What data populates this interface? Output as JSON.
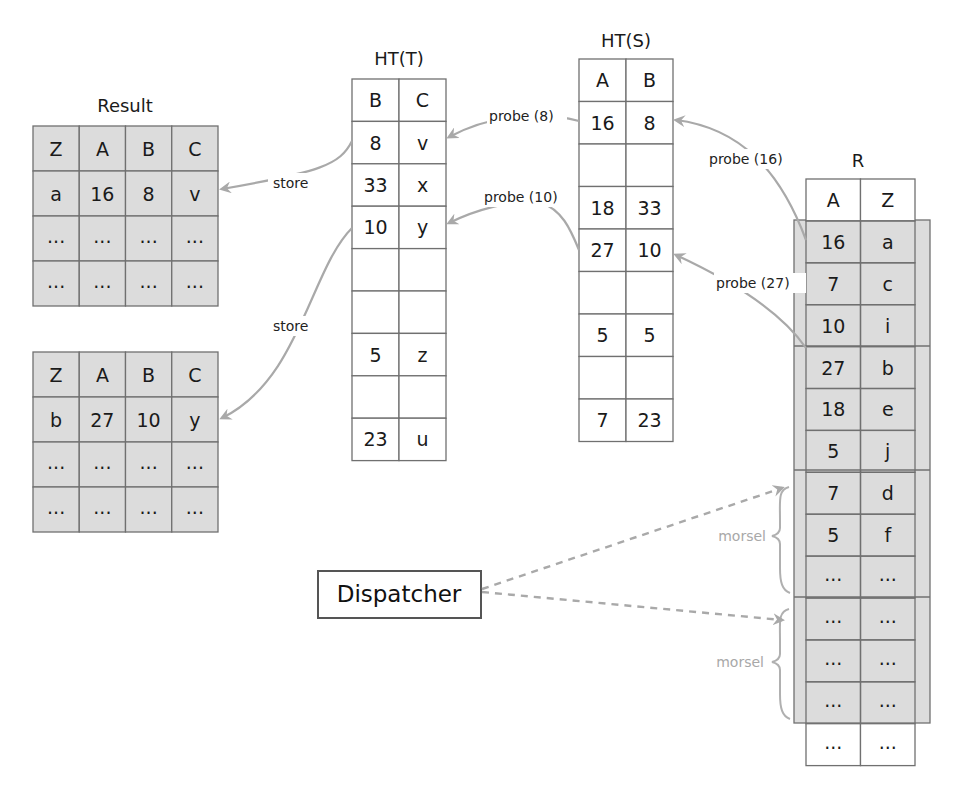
{
  "colors": {
    "shaded_fill": "#dcdcdc",
    "grid_line": "#707070",
    "arrow": "#a9a9a9",
    "morsel_text": "#a8a8a8",
    "text": "#1a1a1a"
  },
  "result": {
    "title": "Result",
    "tables": [
      {
        "headers": [
          "Z",
          "A",
          "B",
          "C"
        ],
        "rows": [
          [
            "a",
            "16",
            "8",
            "v"
          ],
          [
            "...",
            "...",
            "...",
            "..."
          ],
          [
            "...",
            "...",
            "...",
            "..."
          ]
        ]
      },
      {
        "headers": [
          "Z",
          "A",
          "B",
          "C"
        ],
        "rows": [
          [
            "b",
            "27",
            "10",
            "y"
          ],
          [
            "...",
            "...",
            "...",
            "..."
          ],
          [
            "...",
            "...",
            "...",
            "..."
          ]
        ]
      }
    ]
  },
  "ht_t": {
    "title": "HT(T)",
    "headers": [
      "B",
      "C"
    ],
    "rows": [
      [
        "8",
        "v"
      ],
      [
        "33",
        "x"
      ],
      [
        "10",
        "y"
      ],
      [
        "",
        ""
      ],
      [
        "",
        ""
      ],
      [
        "5",
        "z"
      ],
      [
        "",
        ""
      ],
      [
        "23",
        "u"
      ]
    ]
  },
  "ht_s": {
    "title": "HT(S)",
    "headers": [
      "A",
      "B"
    ],
    "rows": [
      [
        "16",
        "8"
      ],
      [
        "",
        ""
      ],
      [
        "18",
        "33"
      ],
      [
        "27",
        "10"
      ],
      [
        "",
        ""
      ],
      [
        "5",
        "5"
      ],
      [
        "",
        ""
      ],
      [
        "7",
        "23"
      ]
    ]
  },
  "r": {
    "title": "R",
    "headers": [
      "A",
      "Z"
    ],
    "rows": [
      [
        "16",
        "a"
      ],
      [
        "7",
        "c"
      ],
      [
        "10",
        "i"
      ],
      [
        "27",
        "b"
      ],
      [
        "18",
        "e"
      ],
      [
        "5",
        "j"
      ],
      [
        "7",
        "d"
      ],
      [
        "5",
        "f"
      ],
      [
        "...",
        "..."
      ],
      [
        "...",
        "..."
      ],
      [
        "...",
        "..."
      ],
      [
        "...",
        "..."
      ],
      [
        "...",
        "..."
      ]
    ]
  },
  "arrows": {
    "store_1": "store",
    "store_2": "store",
    "probe_8": "probe (8)",
    "probe_10": "probe (10)",
    "probe_16": "probe (16)",
    "probe_27": "probe (27)"
  },
  "morsels": [
    "morsel",
    "morsel"
  ],
  "dispatcher": {
    "label": "Dispatcher"
  }
}
